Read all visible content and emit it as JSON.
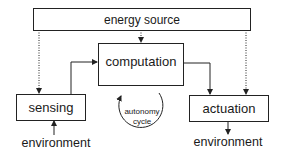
{
  "diagram": {
    "nodes": {
      "energy_source": "energy source",
      "computation": "computation",
      "sensing": "sensing",
      "actuation": "actuation",
      "environment_in": "environment",
      "environment_out": "environment",
      "cycle_line1": "autonomy",
      "cycle_line2": "cycle"
    },
    "edges": [
      {
        "from": "energy source",
        "to": "computation",
        "style": "dotted"
      },
      {
        "from": "energy source",
        "to": "sensing",
        "style": "dotted"
      },
      {
        "from": "energy source",
        "to": "actuation",
        "style": "dotted"
      },
      {
        "from": "sensing",
        "to": "computation",
        "style": "solid"
      },
      {
        "from": "computation",
        "to": "actuation",
        "style": "solid"
      },
      {
        "from": "environment",
        "to": "sensing",
        "style": "solid"
      },
      {
        "from": "actuation",
        "to": "environment",
        "style": "solid"
      }
    ]
  }
}
